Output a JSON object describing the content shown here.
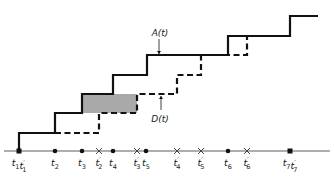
{
  "diagram": {
    "type": "queue-arrival-departure-step-diagram",
    "colors": {
      "line": "#111111",
      "axis": "#333333",
      "shaded": "#a9a9a9"
    },
    "axis": {
      "y": 151,
      "x_start": 4,
      "x_end": 330
    },
    "curves": {
      "arrival": {
        "label": "A(t)",
        "style": "solid",
        "points": [
          [
            19,
            151
          ],
          [
            19,
            133
          ],
          [
            55,
            133
          ],
          [
            55,
            113
          ],
          [
            82,
            113
          ],
          [
            82,
            94
          ],
          [
            113,
            94
          ],
          [
            113,
            75
          ],
          [
            147,
            75
          ],
          [
            147,
            55
          ],
          [
            228,
            55
          ],
          [
            228,
            36
          ],
          [
            290,
            36
          ],
          [
            290,
            16
          ],
          [
            318,
            16
          ]
        ],
        "label_pos": [
          160,
          36
        ],
        "arrow": {
          "x": 159,
          "y1": 39,
          "y2": 54
        }
      },
      "departure": {
        "label": "D(t)",
        "style": "dashed",
        "points": [
          [
            55,
            133
          ],
          [
            99,
            133
          ],
          [
            99,
            113
          ],
          [
            137,
            113
          ],
          [
            137,
            94
          ],
          [
            177,
            94
          ],
          [
            177,
            75
          ],
          [
            201,
            75
          ],
          [
            201,
            55
          ],
          [
            247,
            55
          ],
          [
            247,
            36
          ]
        ],
        "label_pos": [
          160,
          122
        ],
        "arrow": {
          "x": 161,
          "y1": 110,
          "y2": 96
        }
      }
    },
    "shaded_region": {
      "x": 82,
      "y": 94,
      "width": 55,
      "height": 19
    },
    "events": [
      {
        "x": 19,
        "marker": "square",
        "labels": [
          {
            "base": "t",
            "sub": "1",
            "prime": false
          },
          {
            "base": "t",
            "sub": "1",
            "prime": true
          }
        ]
      },
      {
        "x": 55,
        "marker": "dot",
        "labels": [
          {
            "base": "t",
            "sub": "2",
            "prime": false
          }
        ]
      },
      {
        "x": 82,
        "marker": "dot",
        "labels": [
          {
            "base": "t",
            "sub": "3",
            "prime": false
          }
        ]
      },
      {
        "x": 99,
        "marker": "cross",
        "labels": [
          {
            "base": "t",
            "sub": "2",
            "prime": true
          }
        ]
      },
      {
        "x": 113,
        "marker": "dot",
        "labels": [
          {
            "base": "t",
            "sub": "4",
            "prime": false
          }
        ]
      },
      {
        "x": 137,
        "marker": "cross",
        "labels": [
          {
            "base": "t",
            "sub": "3",
            "prime": true
          }
        ]
      },
      {
        "x": 146,
        "marker": "dot",
        "labels": [
          {
            "base": "t",
            "sub": "5",
            "prime": false
          }
        ]
      },
      {
        "x": 177,
        "marker": "cross",
        "labels": [
          {
            "base": "t",
            "sub": "4",
            "prime": true
          }
        ]
      },
      {
        "x": 201,
        "marker": "cross",
        "labels": [
          {
            "base": "t",
            "sub": "5",
            "prime": true
          }
        ]
      },
      {
        "x": 228,
        "marker": "dot",
        "labels": [
          {
            "base": "t",
            "sub": "6",
            "prime": false
          }
        ]
      },
      {
        "x": 247,
        "marker": "cross",
        "labels": [
          {
            "base": "t",
            "sub": "6",
            "prime": true
          }
        ]
      },
      {
        "x": 290,
        "marker": "square",
        "labels": [
          {
            "base": "t",
            "sub": "7",
            "prime": false
          },
          {
            "base": "t",
            "sub": "7",
            "prime": true
          }
        ]
      }
    ]
  }
}
